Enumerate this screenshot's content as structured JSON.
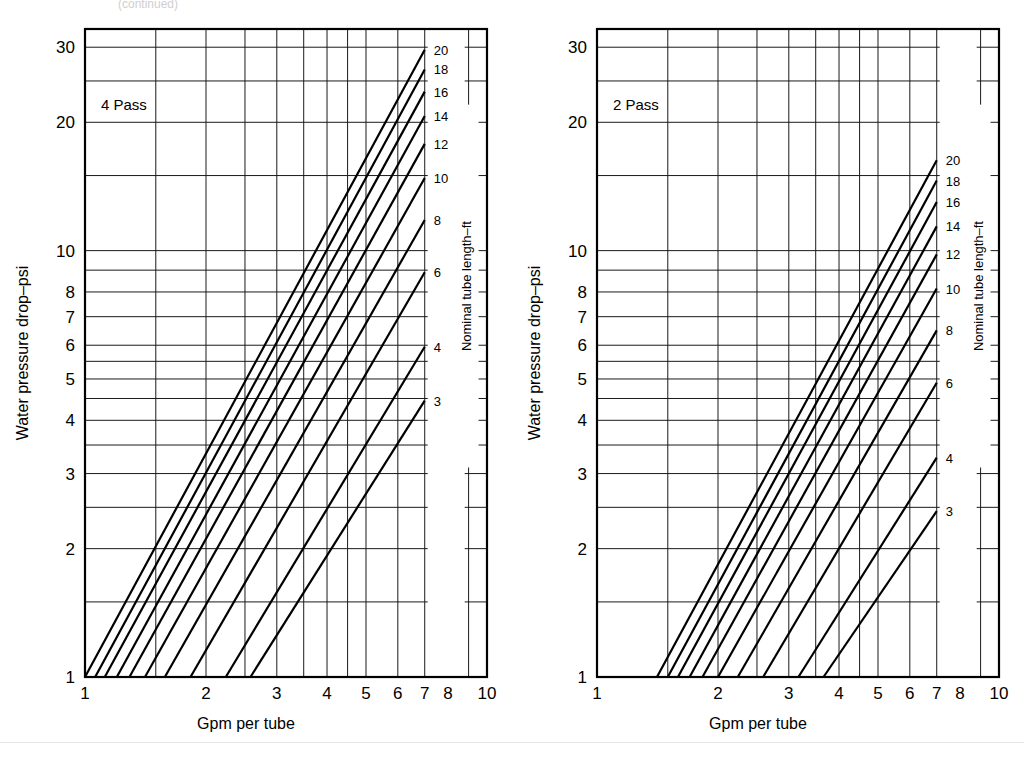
{
  "page": {
    "top_note": "(continued)",
    "background": "#ffffff",
    "line_color": "#000000",
    "grid_color": "#1a1a1a"
  },
  "charts": [
    {
      "id": "left",
      "pass_label": "4 Pass",
      "xlabel": "Gpm per tube",
      "ylabel": "Water pressure drop–psi",
      "legend_title": "Nominal tube length–ft",
      "x_ticks": [
        "1",
        "2",
        "3",
        "4",
        "5",
        "6",
        "7",
        "8",
        "10"
      ],
      "y_ticks": [
        "1",
        "2",
        "3",
        "4",
        "5",
        "6",
        "7",
        "8",
        "10",
        "20",
        "30"
      ],
      "tube_lengths": [
        "20",
        "18",
        "16",
        "14",
        "12",
        "10",
        "8",
        "6",
        "4",
        "3"
      ]
    },
    {
      "id": "right",
      "pass_label": "2 Pass",
      "xlabel": "Gpm per tube",
      "ylabel": "Water pressure drop–psi",
      "legend_title": "Nominal tube length–ft",
      "x_ticks": [
        "1",
        "2",
        "3",
        "4",
        "5",
        "6",
        "7",
        "8",
        "10"
      ],
      "y_ticks": [
        "1",
        "2",
        "3",
        "4",
        "5",
        "6",
        "7",
        "8",
        "10",
        "20",
        "30"
      ],
      "tube_lengths": [
        "20",
        "18",
        "16",
        "14",
        "12",
        "10",
        "8",
        "6",
        "4",
        "3"
      ]
    }
  ],
  "chart_data": [
    {
      "type": "line",
      "id": "left",
      "title": "4 Pass",
      "xlabel": "Gpm per tube",
      "ylabel": "Water pressure drop–psi",
      "xscale": "log",
      "yscale": "log",
      "xlim": [
        1,
        10
      ],
      "ylim": [
        1,
        33
      ],
      "grid": true,
      "legend_title": "Nominal tube length–ft",
      "legend_position": "right-inside",
      "x_ticks": [
        1,
        2,
        3,
        4,
        5,
        6,
        7,
        8,
        10
      ],
      "y_ticks": [
        1,
        2,
        3,
        4,
        5,
        6,
        7,
        8,
        10,
        20,
        30
      ],
      "x_minor_gridlines": [
        1.5,
        2.5,
        3.5,
        4.5,
        9
      ],
      "y_minor_gridlines": [
        1.5,
        2.5,
        3.5,
        4.5,
        5.5,
        9,
        15,
        25
      ],
      "series": [
        {
          "name": "20",
          "points": [
            [
              1.0,
              1.0
            ],
            [
              7.0,
              29.6
            ]
          ]
        },
        {
          "name": "18",
          "points": [
            [
              1.06,
              1.0
            ],
            [
              7.0,
              26.6
            ]
          ]
        },
        {
          "name": "16",
          "points": [
            [
              1.12,
              1.0
            ],
            [
              7.0,
              23.6
            ]
          ]
        },
        {
          "name": "14",
          "points": [
            [
              1.2,
              1.0
            ],
            [
              7.0,
              20.7
            ]
          ]
        },
        {
          "name": "12",
          "points": [
            [
              1.29,
              1.0
            ],
            [
              7.0,
              17.8
            ]
          ]
        },
        {
          "name": "10",
          "points": [
            [
              1.41,
              1.0
            ],
            [
              7.0,
              14.8
            ]
          ]
        },
        {
          "name": "8",
          "points": [
            [
              1.58,
              1.0
            ],
            [
              7.0,
              11.8
            ]
          ]
        },
        {
          "name": "6",
          "points": [
            [
              1.83,
              1.0
            ],
            [
              7.0,
              8.9
            ]
          ]
        },
        {
          "name": "4",
          "points": [
            [
              2.24,
              1.0
            ],
            [
              7.0,
              5.95
            ]
          ]
        },
        {
          "name": "3",
          "points": [
            [
              2.58,
              1.0
            ],
            [
              7.0,
              4.45
            ]
          ]
        }
      ]
    },
    {
      "type": "line",
      "id": "right",
      "title": "2 Pass",
      "xlabel": "Gpm per tube",
      "ylabel": "Water pressure drop–psi",
      "xscale": "log",
      "yscale": "log",
      "xlim": [
        1,
        10
      ],
      "ylim": [
        1,
        33
      ],
      "grid": true,
      "legend_title": "Nominal tube length–ft",
      "legend_position": "right-inside",
      "x_ticks": [
        1,
        2,
        3,
        4,
        5,
        6,
        7,
        8,
        10
      ],
      "y_ticks": [
        1,
        2,
        3,
        4,
        5,
        6,
        7,
        8,
        10,
        20,
        30
      ],
      "x_minor_gridlines": [
        1.5,
        2.5,
        3.5,
        4.5,
        9
      ],
      "y_minor_gridlines": [
        1.5,
        2.5,
        3.5,
        4.5,
        5.5,
        9,
        15,
        25
      ],
      "series": [
        {
          "name": "20",
          "points": [
            [
              1.41,
              1.0
            ],
            [
              7.0,
              16.3
            ]
          ]
        },
        {
          "name": "18",
          "points": [
            [
              1.5,
              1.0
            ],
            [
              7.0,
              14.6
            ]
          ]
        },
        {
          "name": "16",
          "points": [
            [
              1.59,
              1.0
            ],
            [
              7.0,
              13.0
            ]
          ]
        },
        {
          "name": "14",
          "points": [
            [
              1.7,
              1.0
            ],
            [
              7.0,
              11.4
            ]
          ]
        },
        {
          "name": "12",
          "points": [
            [
              1.83,
              1.0
            ],
            [
              7.0,
              9.8
            ]
          ]
        },
        {
          "name": "10",
          "points": [
            [
              2.0,
              1.0
            ],
            [
              7.0,
              8.15
            ]
          ]
        },
        {
          "name": "8",
          "points": [
            [
              2.24,
              1.0
            ],
            [
              7.0,
              6.5
            ]
          ]
        },
        {
          "name": "6",
          "points": [
            [
              2.59,
              1.0
            ],
            [
              7.0,
              4.9
            ]
          ]
        },
        {
          "name": "4",
          "points": [
            [
              3.17,
              1.0
            ],
            [
              7.0,
              3.27
            ]
          ]
        },
        {
          "name": "3",
          "points": [
            [
              3.66,
              1.0
            ],
            [
              7.0,
              2.45
            ]
          ]
        }
      ]
    }
  ]
}
